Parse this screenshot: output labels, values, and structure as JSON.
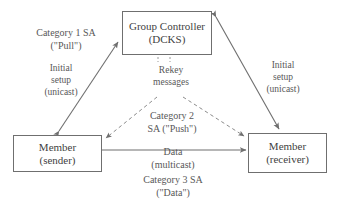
{
  "diagram": {
    "stroke_color": "#6f6f6f",
    "text_color": "#585858",
    "background": "#ffffff",
    "nodes": [
      {
        "id": "group-controller",
        "line1": "Group Controller",
        "line2": "(DCKS)"
      },
      {
        "id": "member-sender",
        "line1": "Member",
        "line2": "(sender)"
      },
      {
        "id": "member-receiver",
        "line1": "Member",
        "line2": "(receiver)"
      }
    ],
    "labels": {
      "category1": {
        "line1": "Category 1 SA",
        "line2": "(\"Pull\")"
      },
      "initial_setup_left": {
        "line1": "Initial",
        "line2": "setup",
        "line3": "(unicast)"
      },
      "initial_setup_right": {
        "line1": "Initial",
        "line2": "setup",
        "line3": "(unicast)"
      },
      "rekey": {
        "line1": "Rekey",
        "line2": "messages"
      },
      "category2": {
        "line1": "Category 2",
        "line2": "SA (\"Push\")"
      },
      "data": {
        "line1": "Data",
        "line2": "(multicast)"
      },
      "category3": {
        "line1": "Category 3 SA",
        "line2": "(\"Data\")"
      }
    },
    "edges": [
      {
        "id": "gc-sender-unicast",
        "from": "group-controller",
        "to": "member-sender",
        "style": "solid",
        "arrows": "both",
        "label": "initial_setup_left"
      },
      {
        "id": "gc-receiver-unicast",
        "from": "group-controller",
        "to": "member-receiver",
        "style": "solid",
        "arrows": "both",
        "label": "initial_setup_right"
      },
      {
        "id": "rekey-to-sender",
        "from": "group-controller",
        "to": "member-sender",
        "style": "dashed",
        "arrows": "to",
        "label": "rekey"
      },
      {
        "id": "rekey-to-receiver",
        "from": "group-controller",
        "to": "member-receiver",
        "style": "dashed",
        "arrows": "to",
        "label": "rekey"
      },
      {
        "id": "data-multicast",
        "from": "member-sender",
        "to": "member-receiver",
        "style": "solid",
        "arrows": "to",
        "label": "data"
      }
    ]
  }
}
